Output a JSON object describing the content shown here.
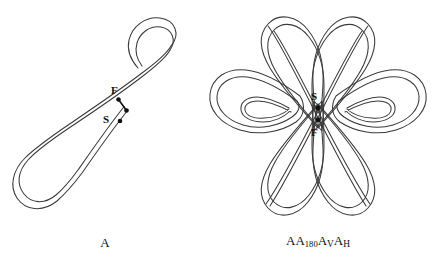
{
  "figure": {
    "background_color": "#ffffff",
    "line_color": "#3a3a3a",
    "marker_color": "#111111",
    "width": 440,
    "height": 259
  },
  "panels": [
    {
      "id": "panel-a",
      "caption": "A",
      "description": "single open ribbon curve forming one hook loop",
      "markers": [
        {
          "label": "F",
          "role": "finish-point"
        },
        {
          "label": "S",
          "role": "start-point"
        }
      ]
    },
    {
      "id": "panel-b",
      "caption_parts": {
        "part1": "AA",
        "sub1": "180",
        "part2": "A",
        "sub2": "V",
        "part3": "A",
        "sub3": "H"
      },
      "caption_plain": "AA180AVAH",
      "description": "four-lobed braided ribbon knot with crossings",
      "markers": [
        {
          "label": "S",
          "role": "start-point"
        },
        {
          "label": "F",
          "role": "finish-point"
        }
      ]
    }
  ]
}
